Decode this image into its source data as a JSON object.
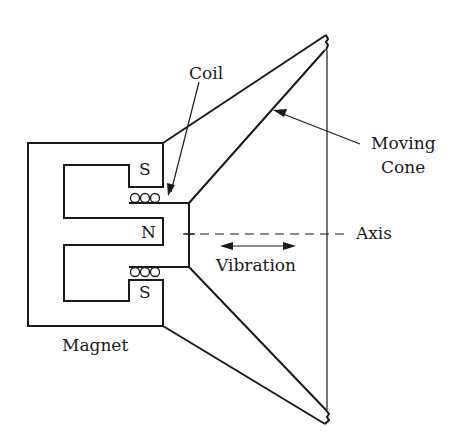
{
  "diagram": {
    "labels": {
      "coil": "Coil",
      "moving_cone": [
        "Moving",
        "Cone"
      ],
      "axis": "Axis",
      "vibration": "Vibration",
      "magnet": "Magnet"
    },
    "poles": {
      "top": "S",
      "center": "N",
      "bottom": "S"
    },
    "colors": {
      "ink": "#1a1a1a",
      "background": "#ffffff"
    }
  }
}
